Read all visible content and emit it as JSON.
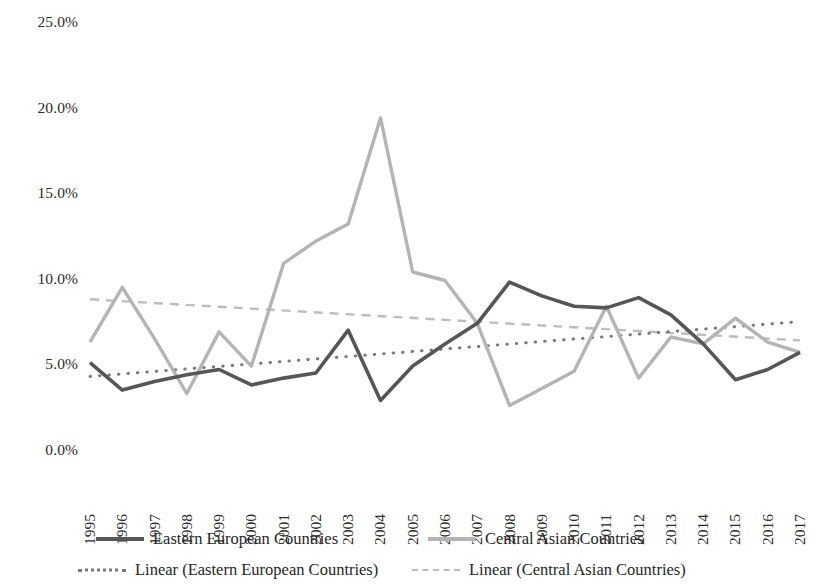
{
  "chart_data": {
    "type": "line",
    "title": "",
    "xlabel": "",
    "ylabel": "",
    "ylim": [
      0,
      25
    ],
    "ytick_values": [
      0,
      5,
      10,
      15,
      20,
      25
    ],
    "ytick_labels": [
      "0.0%",
      "5.0%",
      "10.0%",
      "15.0%",
      "20.0%",
      "25.0%"
    ],
    "grid": false,
    "legend_position": "bottom",
    "categories": [
      "1995",
      "1996",
      "1997",
      "1998",
      "1999",
      "2000",
      "2001",
      "2002",
      "2003",
      "2004",
      "2005",
      "2006",
      "2007",
      "2008",
      "2009",
      "2010",
      "2011",
      "2012",
      "2013",
      "2014",
      "2015",
      "2016",
      "2017"
    ],
    "series": [
      {
        "name": "Eastern European Countries",
        "color": "#565656",
        "style": "solid",
        "values": [
          5.1,
          3.5,
          4.0,
          4.4,
          4.7,
          3.8,
          4.2,
          4.5,
          7.0,
          2.9,
          4.9,
          6.2,
          7.4,
          9.8,
          9.0,
          8.4,
          8.3,
          8.9,
          7.9,
          6.2,
          4.1,
          4.7,
          5.7
        ]
      },
      {
        "name": "Central Asian Countries",
        "color": "#b4b4b4",
        "style": "solid",
        "values": [
          6.3,
          9.5,
          6.5,
          3.3,
          6.9,
          4.9,
          10.9,
          12.2,
          13.2,
          19.4,
          10.4,
          9.9,
          7.4,
          2.6,
          3.6,
          4.6,
          8.4,
          4.2,
          6.6,
          6.2,
          7.7,
          6.3,
          5.7
        ]
      },
      {
        "name": "Linear (Eastern European Countries)",
        "color": "#7a7a7a",
        "style": "dotted",
        "trend": true,
        "endpoints": [
          4.3,
          7.5
        ]
      },
      {
        "name": "Linear (Central Asian Countries)",
        "color": "#bdbdbd",
        "style": "dashed",
        "trend": true,
        "endpoints": [
          8.8,
          6.4
        ]
      }
    ]
  },
  "legend": {
    "entries": [
      {
        "label": "Eastern European Countries",
        "swatch": "solid-line-dark-swatch"
      },
      {
        "label": "Central Asian Countries",
        "swatch": "solid-line-light-swatch"
      },
      {
        "label": "Linear (Eastern European Countries)",
        "swatch": "dotted-line-swatch"
      },
      {
        "label": "Linear (Central Asian Countries)",
        "swatch": "dashed-line-swatch"
      }
    ]
  }
}
